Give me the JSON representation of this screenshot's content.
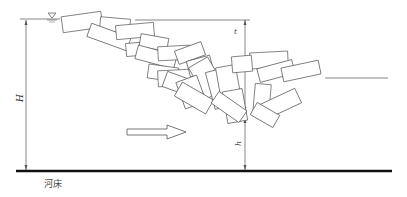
{
  "diagram": {
    "labels": {
      "H": "H",
      "t": "t",
      "h": "h",
      "riverbed": "河床"
    },
    "icons": {
      "water_level": "water-level-triangle",
      "flow_arrow": "flow-direction-arrow"
    },
    "colors": {
      "line": "#555555",
      "bed": "#111111",
      "background": "#ffffff"
    }
  }
}
